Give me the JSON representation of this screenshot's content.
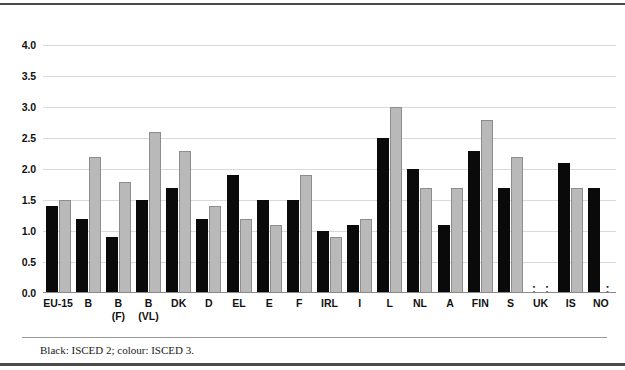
{
  "footnote": "Black: ISCED 2; colour: ISCED 3.",
  "legend": {
    "black_label": "ISCED 2",
    "colour_label": "ISCED 3"
  },
  "colors": {
    "series_black": "#0a0a0a",
    "series_colour": "#b9b9b9",
    "gridline": "#d9d9d9",
    "rule": "#4a4a4a",
    "background": "#ffffff"
  },
  "axis": {
    "y_ticks": [
      "0.0",
      "0.5",
      "1.0",
      "1.5",
      "2.0",
      "2.5",
      "3.0",
      "3.5",
      "4.0"
    ],
    "y_min": 0.0,
    "y_max": 4.25,
    "no_data_marker": ":"
  },
  "chart_data": {
    "type": "bar",
    "title": "",
    "subtitle": "",
    "xlabel": "",
    "ylabel": "",
    "ylim": [
      0,
      4.25
    ],
    "ytick_step": 0.5,
    "grid": true,
    "legend_position": "below-as-footnote",
    "categories": [
      "EU-15",
      "B",
      "B\n(F)",
      "B\n(VL)",
      "DK",
      "D",
      "EL",
      "E",
      "F",
      "IRL",
      "I",
      "L",
      "NL",
      "A",
      "FIN",
      "S",
      "UK",
      "IS",
      "NO"
    ],
    "series": [
      {
        "name": "ISCED 2",
        "color": "#0a0a0a",
        "values": [
          1.4,
          1.2,
          0.9,
          1.5,
          1.7,
          1.2,
          1.9,
          1.5,
          1.5,
          1.0,
          1.1,
          2.5,
          2.0,
          1.1,
          2.3,
          1.7,
          null,
          2.1,
          1.7
        ]
      },
      {
        "name": "ISCED 3",
        "color": "#b9b9b9",
        "values": [
          1.5,
          2.2,
          1.8,
          2.6,
          2.3,
          1.4,
          1.2,
          1.1,
          1.9,
          0.9,
          1.2,
          3.0,
          1.7,
          1.7,
          2.8,
          2.2,
          null,
          1.7,
          null
        ]
      }
    ],
    "annotations": [
      "Black: ISCED 2; colour: ISCED 3."
    ]
  }
}
